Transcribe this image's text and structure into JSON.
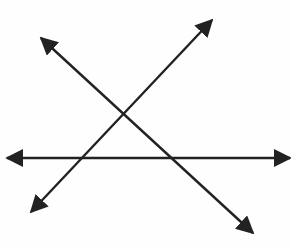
{
  "diagram": {
    "title": "",
    "colors": {
      "background": "#fefefe",
      "stroke": "#222222"
    },
    "lines": [
      {
        "id": "line-horizontal",
        "x1": 7,
        "y1": 158,
        "x2": 290,
        "y2": 158
      },
      {
        "id": "line-rising",
        "x1": 31,
        "y1": 212,
        "x2": 212,
        "y2": 20
      },
      {
        "id": "line-falling",
        "x1": 41,
        "y1": 38,
        "x2": 253,
        "y2": 233
      }
    ],
    "intersections": [
      {
        "between": [
          "line-rising",
          "line-falling"
        ],
        "x": 123,
        "y": 114
      },
      {
        "between": [
          "line-rising",
          "line-horizontal"
        ],
        "x": 82,
        "y": 158
      },
      {
        "between": [
          "line-falling",
          "line-horizontal"
        ],
        "x": 171,
        "y": 158
      }
    ]
  }
}
